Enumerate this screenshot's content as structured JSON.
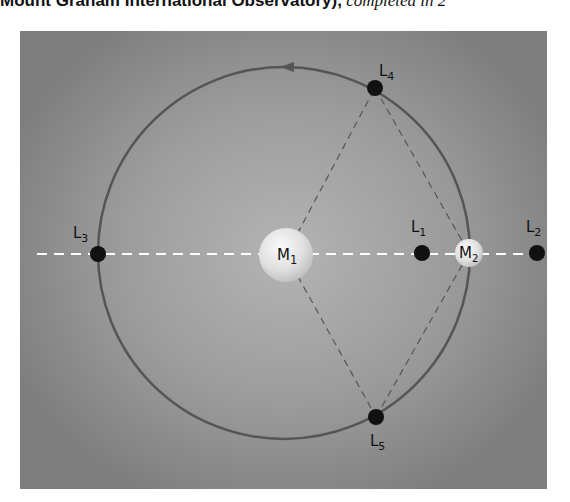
{
  "caption": {
    "bold_text": "Mount Graham International Observatory),",
    "italic_text": " completed in 2"
  },
  "diagram": {
    "orbit": {
      "cx": 284,
      "cy": 253,
      "r": 186,
      "color": "#555555",
      "direction_arrow": "counterclockwise"
    },
    "axis_line": {
      "y": 254,
      "x_start": 37,
      "x_end": 540,
      "color": "#ffffff",
      "style": "dashed"
    },
    "bodies": [
      {
        "id": "M1",
        "label": "M",
        "sub": "1",
        "x": 286,
        "y": 255,
        "r": 27
      },
      {
        "id": "M2",
        "label": "M",
        "sub": "2",
        "x": 469,
        "y": 253,
        "r": 14
      }
    ],
    "points": [
      {
        "id": "L1",
        "label": "L",
        "sub": "1",
        "x": 422,
        "y": 253,
        "lx": 411,
        "ly": 232
      },
      {
        "id": "L2",
        "label": "L",
        "sub": "2",
        "x": 537,
        "y": 253,
        "lx": 526,
        "ly": 232
      },
      {
        "id": "L3",
        "label": "L",
        "sub": "3",
        "x": 98,
        "y": 254,
        "lx": 73,
        "ly": 238
      },
      {
        "id": "L4",
        "label": "L",
        "sub": "4",
        "x": 375,
        "y": 88,
        "lx": 379,
        "ly": 76
      },
      {
        "id": "L5",
        "label": "L",
        "sub": "5",
        "x": 376,
        "y": 417,
        "lx": 370,
        "ly": 446
      }
    ],
    "triangle_lines": [
      {
        "from": "M1",
        "to": "L4"
      },
      {
        "from": "L4",
        "to": "M2"
      },
      {
        "from": "M1",
        "to": "L5"
      },
      {
        "from": "L5",
        "to": "M2"
      }
    ],
    "colors": {
      "point": "#111111",
      "body": "#e6e6e6",
      "dash_triangle": "#555555"
    }
  }
}
